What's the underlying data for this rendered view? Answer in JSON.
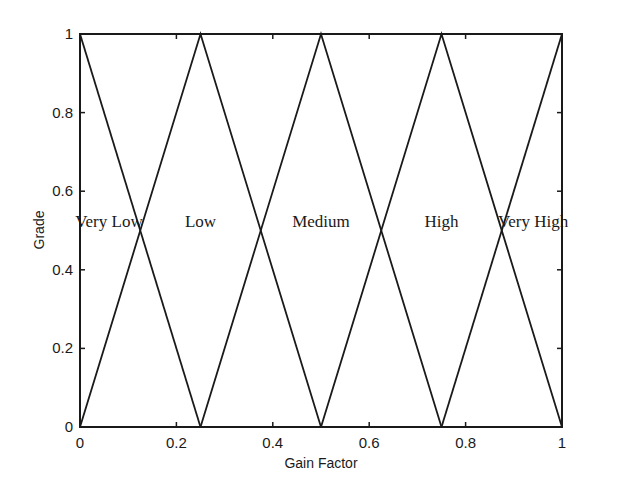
{
  "chart_data": {
    "type": "line",
    "title": "",
    "xlabel": "Gain Factor",
    "ylabel": "Grade",
    "xlim": [
      0,
      1
    ],
    "ylim": [
      0,
      1
    ],
    "grid": false,
    "legend": null,
    "x_ticks": [
      "0",
      "0.2",
      "0.4",
      "0.6",
      "0.8",
      "1"
    ],
    "y_ticks": [
      "0",
      "0.2",
      "0.4",
      "0.6",
      "0.8",
      "1"
    ],
    "series": [
      {
        "name": "Very Low",
        "x": [
          0,
          0.25
        ],
        "y": [
          1,
          0
        ],
        "peak": 0
      },
      {
        "name": "Low",
        "x": [
          0,
          0.25,
          0.5
        ],
        "y": [
          0,
          1,
          0
        ],
        "peak": 0.25
      },
      {
        "name": "Medium",
        "x": [
          0.25,
          0.5,
          0.75
        ],
        "y": [
          0,
          1,
          0
        ],
        "peak": 0.5
      },
      {
        "name": "High",
        "x": [
          0.5,
          0.75,
          1
        ],
        "y": [
          0,
          1,
          0
        ],
        "peak": 0.75
      },
      {
        "name": "Very High",
        "x": [
          0.75,
          1
        ],
        "y": [
          0,
          1
        ],
        "peak": 1
      }
    ],
    "annotations": [
      {
        "text": "Very Low",
        "x": 0.06,
        "y": 0.5
      },
      {
        "text": "Low",
        "x": 0.25,
        "y": 0.5
      },
      {
        "text": "Medium",
        "x": 0.5,
        "y": 0.5
      },
      {
        "text": "High",
        "x": 0.75,
        "y": 0.5
      },
      {
        "text": "Very High",
        "x": 0.94,
        "y": 0.5
      }
    ]
  },
  "colors": {
    "line": "#1a1a1a",
    "background": "#ffffff"
  }
}
